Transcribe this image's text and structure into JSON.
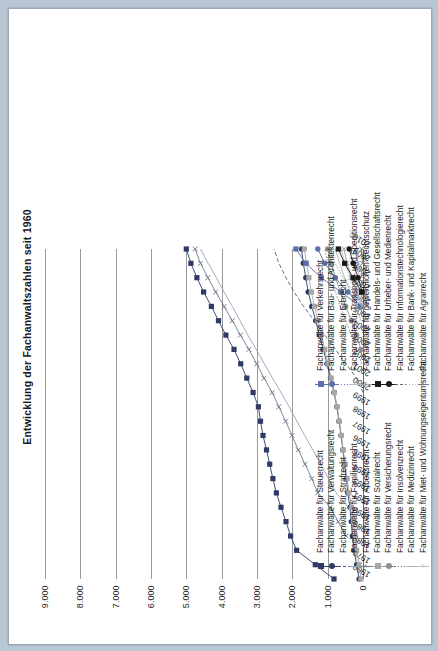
{
  "page": {
    "background_color": "#b9c7d4",
    "paper_color": "#ffffff"
  },
  "chart_data": {
    "type": "line",
    "title": "Entwicklung der Fachanwaltszahlen seit 1960",
    "xlabel": "",
    "ylabel": "",
    "grid": true,
    "legend_position": "bottom",
    "ylim": [
      0,
      9000
    ],
    "yticks": [
      "0",
      "1.000",
      "2.000",
      "3.000",
      "4.000",
      "5.000",
      "6.000",
      "7.000",
      "8.000",
      "9.000"
    ],
    "ytick_values": [
      0,
      1000,
      2000,
      3000,
      4000,
      5000,
      6000,
      7000,
      8000,
      9000
    ],
    "categories": [
      "1960",
      "1970",
      "1980",
      "1989",
      "1990",
      "1991",
      "1993",
      "1994",
      "1995",
      "1996",
      "1997",
      "1998",
      "1999",
      "2000",
      "2001",
      "2002",
      "2003",
      "2004",
      "2005",
      "2006",
      "2007",
      "2008",
      "2009",
      "2010"
    ],
    "series": [
      {
        "name": "Fachanwälte für Steuerrecht",
        "color": "#2f3a66",
        "marker": "square",
        "line": "solid",
        "values": [
          820,
          1350,
          1880,
          2050,
          2180,
          2320,
          2450,
          2550,
          2640,
          2730,
          2830,
          2900,
          2960,
          3110,
          3290,
          3460,
          3650,
          3880,
          4090,
          4290,
          4510,
          4700,
          4870,
          5000
        ]
      },
      {
        "name": "Fachanwälte für Verwaltungsrecht",
        "color": "#2f3a66",
        "marker": "circle",
        "line": "solid",
        "values": [
          110,
          180,
          250,
          300,
          330,
          370,
          430,
          470,
          520,
          570,
          620,
          680,
          740,
          820,
          920,
          1020,
          1120,
          1240,
          1340,
          1450,
          1550,
          1620,
          1690,
          1740
        ]
      },
      {
        "name": "Fachanwälte für Strafrecht",
        "color": "#4a5a78",
        "marker": "none",
        "line": "dashed",
        "values": [
          null,
          null,
          null,
          null,
          null,
          null,
          null,
          null,
          null,
          null,
          null,
          null,
          null,
          0,
          180,
          480,
          780,
          1080,
          1380,
          1680,
          1950,
          2180,
          2380,
          2520
        ]
      },
      {
        "name": "Fachanwälte für Familienrecht",
        "color": "#9aa3b0",
        "marker": "none",
        "line": "solid",
        "values": [
          null,
          null,
          null,
          null,
          180,
          420,
          760,
          980,
          1200,
          1420,
          1650,
          1870,
          2090,
          2320,
          2560,
          2790,
          3020,
          3260,
          3480,
          3700,
          3930,
          4150,
          4380,
          4600
        ]
      },
      {
        "name": "Fachanwälte für Arbeitsrecht",
        "color": "#6f7a8c",
        "marker": "x",
        "line": "solid",
        "values": [
          null,
          null,
          null,
          480,
          700,
          930,
          1280,
          1450,
          1640,
          1830,
          2010,
          2190,
          2380,
          2570,
          2800,
          3010,
          3230,
          3470,
          3700,
          3930,
          4170,
          4390,
          4600,
          4750
        ]
      },
      {
        "name": "Fachanwälte für Sozialrecht",
        "color": "#a7a7a7",
        "marker": "square",
        "line": "solid",
        "values": [
          60,
          110,
          180,
          230,
          270,
          320,
          400,
          450,
          500,
          560,
          610,
          670,
          730,
          810,
          900,
          990,
          1080,
          1180,
          1280,
          1370,
          1460,
          1530,
          1600,
          1660
        ]
      },
      {
        "name": "Fachanwälte für Versicherungsrecht",
        "color": "#8e8e8e",
        "marker": "circle",
        "line": "solid",
        "values": [
          null,
          null,
          null,
          null,
          null,
          null,
          null,
          null,
          null,
          null,
          null,
          null,
          null,
          null,
          null,
          null,
          60,
          180,
          330,
          490,
          640,
          780,
          900,
          1000
        ]
      },
      {
        "name": "Fachanwälte für Insolvenzrecht",
        "color": "#717171",
        "marker": "none",
        "line": "dotted",
        "values": [
          null,
          null,
          null,
          null,
          null,
          null,
          null,
          null,
          null,
          null,
          null,
          null,
          null,
          null,
          null,
          40,
          170,
          330,
          490,
          640,
          780,
          900,
          1000,
          1080
        ]
      },
      {
        "name": "Fachanwälte für Medizinrecht",
        "color": "#b3b3b3",
        "marker": "none",
        "line": "solid",
        "values": [
          null,
          null,
          null,
          null,
          null,
          null,
          null,
          null,
          null,
          null,
          null,
          null,
          null,
          null,
          null,
          null,
          null,
          null,
          60,
          200,
          360,
          520,
          660,
          780
        ]
      },
      {
        "name": "Fachanwälte für Miet- und Wohnungseigentumsrecht",
        "color": "#c2c2c2",
        "marker": "x",
        "line": "solid",
        "values": [
          null,
          null,
          null,
          null,
          null,
          null,
          null,
          null,
          null,
          null,
          null,
          null,
          null,
          null,
          null,
          null,
          null,
          null,
          null,
          50,
          200,
          360,
          500,
          620
        ]
      },
      {
        "name": "Fachanwälte für Verkehrsrecht",
        "color": "#5b6fa8",
        "marker": "square",
        "line": "solid",
        "values": [
          null,
          null,
          null,
          null,
          null,
          null,
          null,
          null,
          null,
          null,
          null,
          null,
          null,
          null,
          null,
          null,
          null,
          null,
          null,
          80,
          620,
          1180,
          1620,
          1900
        ]
      },
      {
        "name": "Fachanwälte für Bau- und Architektenrecht",
        "color": "#5b6fa8",
        "marker": "circle",
        "line": "solid",
        "values": [
          null,
          null,
          null,
          null,
          null,
          null,
          null,
          null,
          null,
          null,
          null,
          null,
          null,
          null,
          null,
          null,
          null,
          null,
          null,
          60,
          430,
          790,
          1080,
          1280
        ]
      },
      {
        "name": "Fachanwälte für Erbrecht",
        "color": "#6f7fae",
        "marker": "none",
        "line": "dotted",
        "values": [
          null,
          null,
          null,
          null,
          null,
          null,
          null,
          null,
          null,
          null,
          null,
          null,
          null,
          null,
          null,
          null,
          null,
          null,
          null,
          40,
          280,
          560,
          790,
          960
        ]
      },
      {
        "name": "Fachanwälte für Transport- und Speditionsrecht",
        "color": "#b9c0cc",
        "marker": "none",
        "line": "solid",
        "values": [
          null,
          null,
          null,
          null,
          null,
          null,
          null,
          null,
          null,
          null,
          null,
          null,
          null,
          null,
          null,
          null,
          null,
          null,
          null,
          10,
          60,
          110,
          150,
          180
        ]
      },
      {
        "name": "Fachanwälte für gewerblichen Rechtsschutz",
        "color": "#9aa3b0",
        "marker": "x",
        "line": "solid",
        "values": [
          null,
          null,
          null,
          null,
          null,
          null,
          null,
          null,
          null,
          null,
          null,
          null,
          null,
          null,
          null,
          null,
          null,
          null,
          null,
          20,
          160,
          320,
          450,
          540
        ]
      },
      {
        "name": "Fachanwälte für Handels- und Gesellschaftsrecht",
        "color": "#1a1a1a",
        "marker": "square",
        "line": "solid",
        "values": [
          null,
          null,
          null,
          null,
          null,
          null,
          null,
          null,
          null,
          null,
          null,
          null,
          null,
          null,
          null,
          null,
          null,
          null,
          null,
          null,
          40,
          280,
          520,
          700
        ]
      },
      {
        "name": "Fachanwälte für Urheber- und Medienrecht",
        "color": "#1a1a1a",
        "marker": "circle",
        "line": "solid",
        "values": [
          null,
          null,
          null,
          null,
          null,
          null,
          null,
          null,
          null,
          null,
          null,
          null,
          null,
          null,
          null,
          null,
          null,
          null,
          null,
          null,
          20,
          140,
          280,
          390
        ]
      },
      {
        "name": "Fachanwälte für Informationstechnologierecht",
        "color": "#58627a",
        "marker": "none",
        "line": "dashed",
        "values": [
          null,
          null,
          null,
          null,
          null,
          null,
          null,
          null,
          null,
          null,
          null,
          null,
          null,
          null,
          null,
          null,
          null,
          null,
          null,
          null,
          null,
          30,
          130,
          230
        ]
      },
      {
        "name": "Fachanwälte für Bank- und Kapitalmarktrecht",
        "color": "#b3b3b3",
        "marker": "none",
        "line": "dotted",
        "values": [
          null,
          null,
          null,
          null,
          null,
          null,
          null,
          null,
          null,
          null,
          null,
          null,
          null,
          null,
          null,
          null,
          null,
          null,
          null,
          null,
          null,
          20,
          90,
          170
        ]
      },
      {
        "name": "Fachanwälte für Agrarrecht",
        "color": "#6f7a8c",
        "marker": "x",
        "line": "solid",
        "values": [
          null,
          null,
          null,
          null,
          null,
          null,
          null,
          null,
          null,
          null,
          null,
          null,
          null,
          null,
          null,
          null,
          null,
          null,
          null,
          null,
          null,
          null,
          10,
          40
        ]
      }
    ]
  },
  "legend": {
    "columns": [
      {
        "items": [
          {
            "label": "Fachanwälte für Steuerrecht",
            "color": "#2f3a66",
            "marker": "square",
            "line": "solid"
          },
          {
            "label": "Fachanwälte für Verwaltungsrecht",
            "color": "#2f3a66",
            "marker": "circle",
            "line": "solid"
          },
          {
            "label": "Fachanwälte für Strafrecht",
            "color": "#4a5a78",
            "marker": "none",
            "line": "dashed"
          },
          {
            "label": "Fachanwälte für Familienrecht",
            "color": "#9aa3b0",
            "marker": "none",
            "line": "solid"
          },
          {
            "label": "Fachanwälte für Arbeitsrecht",
            "color": "#6f7a8c",
            "marker": "x",
            "line": "solid"
          },
          {
            "label": "Fachanwälte für Sozialrecht",
            "color": "#a7a7a7",
            "marker": "square",
            "line": "solid"
          },
          {
            "label": "Fachanwälte für Versicherungsrecht",
            "color": "#8e8e8e",
            "marker": "circle",
            "line": "solid"
          },
          {
            "label": "Fachanwälte für Insolvenzrecht",
            "color": "#717171",
            "marker": "none",
            "line": "dotted"
          },
          {
            "label": "Fachanwälte für Medizinrecht",
            "color": "#b3b3b3",
            "marker": "none",
            "line": "solid"
          },
          {
            "label": "Fachanwälte für Miet- und Wohnungseigentumsrecht",
            "color": "#c2c2c2",
            "marker": "x",
            "line": "solid"
          }
        ]
      },
      {
        "items": [
          {
            "label": "Fachanwälte für Verkehrsrecht",
            "color": "#5b6fa8",
            "marker": "square",
            "line": "solid"
          },
          {
            "label": "Fachanwälte für Bau- und Architektenrecht",
            "color": "#5b6fa8",
            "marker": "circle",
            "line": "solid"
          },
          {
            "label": "Fachanwälte für Erbrecht",
            "color": "#6f7fae",
            "marker": "none",
            "line": "dotted"
          },
          {
            "label": "Fachanwälte für Transport- und Speditionsrecht",
            "color": "#b9c0cc",
            "marker": "none",
            "line": "solid"
          },
          {
            "label": "Fachanwälte für gewerblichen Rechtsschutz",
            "color": "#9aa3b0",
            "marker": "x",
            "line": "solid"
          },
          {
            "label": "Fachanwälte für Handels- und Gesellschaftsrecht",
            "color": "#1a1a1a",
            "marker": "square",
            "line": "solid"
          },
          {
            "label": "Fachanwälte für Urheber- und Medienrecht",
            "color": "#1a1a1a",
            "marker": "circle",
            "line": "solid"
          },
          {
            "label": "Fachanwälte für Informationstechnologierecht",
            "color": "#58627a",
            "marker": "none",
            "line": "dashed"
          },
          {
            "label": "Fachanwälte für Bank- und Kapitalmarktrecht",
            "color": "#b3b3b3",
            "marker": "none",
            "line": "dotted"
          },
          {
            "label": "Fachanwälte für Agrarrecht",
            "color": "#6f7a8c",
            "marker": "x",
            "line": "solid"
          }
        ]
      }
    ]
  }
}
